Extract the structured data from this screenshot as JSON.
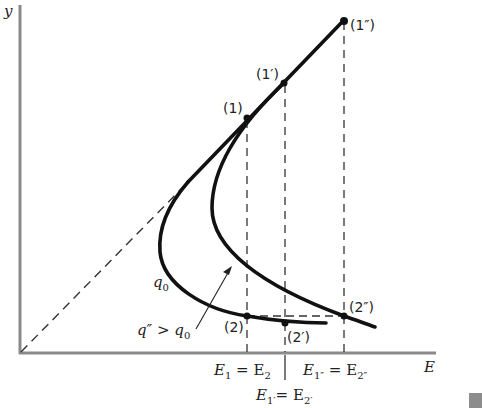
{
  "axes": {
    "y_label": "y",
    "x_label": "E"
  },
  "points": {
    "p1": "(1)",
    "p1p": "(1′)",
    "p1pp": "(1″)",
    "p2": "(2)",
    "p2p": "(2′)",
    "p2pp": "(2″)"
  },
  "curves": {
    "q0_label_main": "q",
    "q0_label_sub": "0",
    "qpp_label_main": "q″ > q",
    "qpp_label_sub": "0"
  },
  "tick_labels": {
    "e1_main": "E",
    "e1_sub": "1",
    "e1_eq": " = E",
    "e1_sub2": "2",
    "e1pp_main": "E",
    "e1pp_sub": "1″",
    "e1pp_eq": " = E",
    "e1pp_sub2": "2″",
    "e1p_main": "E",
    "e1p_sub": "1′",
    "e1p_eq": "= E",
    "e1p_sub2": "2′"
  },
  "colors": {
    "axis": "#8a8a8a",
    "curve": "#111111",
    "dashed": "#333333",
    "marker": "#8c8c8c"
  }
}
